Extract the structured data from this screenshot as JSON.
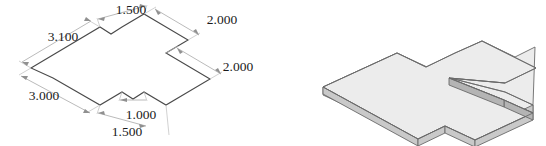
{
  "figure": {
    "background_color": "#ffffff"
  },
  "drawing": {
    "name": "dimensioned-isometric-outline",
    "line_color": "#4a4a4a",
    "dimension_line_color": "#a8a8a8",
    "text_color": "#1a1a1a",
    "dimensions": [
      {
        "id": "dim-top-1500",
        "label": "1.500",
        "x": 131,
        "y": 11,
        "edge": "top-notch-horizontal"
      },
      {
        "id": "dim-top-right-2000",
        "label": "2.000",
        "x": 222,
        "y": 21,
        "edge": "upper-right-side"
      },
      {
        "id": "dim-left-3100",
        "label": "3.100",
        "x": 63,
        "y": 38,
        "edge": "upper-left-side"
      },
      {
        "id": "dim-right-2000",
        "label": "2.000",
        "x": 238,
        "y": 68,
        "edge": "right-notch-side"
      },
      {
        "id": "dim-left-3000",
        "label": "3.000",
        "x": 44,
        "y": 97,
        "edge": "lower-left-side"
      },
      {
        "id": "dim-bottom-1000",
        "label": "1.000",
        "x": 141,
        "y": 116,
        "edge": "bottom-notch-short"
      },
      {
        "id": "dim-bottom-1500",
        "label": "1.500",
        "x": 127,
        "y": 133,
        "edge": "bottom-notch-long"
      }
    ],
    "outline_path": "M 31,68 L 100,27 L 111,34 L 122,27 L 144,14 L 166,27 L 188,40 L 166,53 L 188,66 L 210,79 L 188,92 L 166,105 L 144,92 L 133,99 L 122,92 L 100,105 L 53,78 Z"
  },
  "solid": {
    "name": "isometric-plate-solid",
    "top_face_color": "#ececec",
    "side_face_color": "#c9c9c9",
    "dark_side_color": "#b4b4b4",
    "edge_color": "#6a6a6a",
    "description": "Extruded cross-shaped plate shown in isometric view"
  }
}
